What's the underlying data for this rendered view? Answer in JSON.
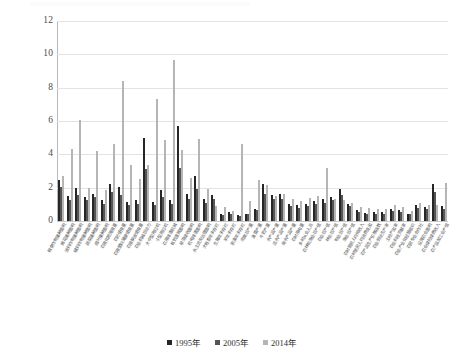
{
  "chart_data": {
    "type": "bar",
    "title": "",
    "subtitle": "",
    "xlabel": "",
    "ylabel": "",
    "ylim": [
      0,
      12
    ],
    "yticks": [
      0,
      2,
      4,
      6,
      8,
      10,
      12
    ],
    "grid": true,
    "legend_position": "bottom",
    "orientation": "vertical",
    "categories": [
      "粮食作物播种面积",
      "棉花播种面积",
      "油料作物播种面积",
      "糖料作物播种面积",
      "蔬菜播种面积",
      "烟叶播种面积",
      "农用化肥施用量",
      "农药使用量",
      "农用塑料薄膜使用量",
      "农用柴油使用量",
      "农业机械总动力",
      "大中型拖拉机",
      "小型拖拉机",
      "农用排灌机械",
      "有效灌溉面积",
      "旱涝保收面积",
      "机电排灌面积",
      "水土流失治理面积",
      "大牲畜年末存栏",
      "生猪年末存栏",
      "羊年末存栏",
      "家禽年末存栏",
      "肉类总产量",
      "禽蛋产量",
      "牛奶产量",
      "水产品产量",
      "淡水产品产量",
      "海水产品产量",
      "农村用电量",
      "乡村从业人员",
      "农林牧渔业总产值",
      "农业总产值",
      "林业总产值",
      "牧业总产值",
      "渔业总产值",
      "农村居民人均纯收入",
      "农村居民人均消费支出",
      "农产品生产价格指数",
      "农业劳动生产率",
      "土地产出率",
      "农业科技贡献率",
      "农业产业化经营组织",
      "农民专业合作社",
      "设施农业面积",
      "农业保险保费收入",
      "农产品加工业产值"
    ],
    "series": [
      {
        "name": "1995年",
        "color": "#262626",
        "values": [
          2.45,
          1.5,
          2.0,
          1.45,
          1.6,
          1.25,
          2.2,
          2.05,
          1.15,
          1.25,
          5.0,
          1.15,
          1.85,
          1.25,
          5.7,
          1.6,
          2.7,
          1.35,
          1.55,
          0.45,
          0.55,
          0.35,
          0.45,
          0.75,
          2.2,
          1.55,
          1.6,
          1.05,
          0.95,
          1.05,
          1.2,
          1.3,
          1.45,
          1.95,
          1.05,
          0.65,
          0.5,
          0.55,
          0.55,
          0.75,
          0.65,
          0.45,
          0.95,
          0.85,
          2.2,
          0.9
        ]
      },
      {
        "name": "2005年",
        "color": "#555555",
        "values": [
          2.05,
          1.25,
          1.55,
          1.25,
          1.45,
          1.0,
          1.75,
          1.55,
          0.95,
          1.05,
          3.15,
          0.95,
          1.45,
          1.05,
          3.2,
          1.3,
          1.95,
          1.1,
          1.3,
          0.35,
          0.45,
          0.3,
          0.4,
          0.65,
          1.65,
          1.3,
          1.35,
          0.9,
          0.8,
          0.9,
          1.0,
          1.1,
          1.25,
          1.55,
          0.9,
          0.55,
          0.45,
          0.45,
          0.45,
          0.6,
          0.55,
          0.4,
          0.8,
          0.7,
          1.75,
          0.75
        ]
      },
      {
        "name": "2014年",
        "color": "#b5b5b5",
        "values": [
          2.7,
          4.35,
          6.05,
          2.0,
          4.2,
          1.85,
          4.6,
          8.4,
          3.35,
          2.55,
          3.35,
          7.35,
          4.85,
          9.65,
          4.25,
          2.6,
          4.9,
          1.95,
          0.9,
          0.85,
          0.6,
          4.6,
          1.2,
          2.45,
          2.15,
          1.5,
          1.65,
          1.35,
          1.2,
          1.4,
          1.5,
          3.2,
          1.3,
          1.25,
          1.1,
          0.85,
          0.8,
          0.75,
          0.7,
          0.95,
          0.85,
          0.6,
          1.1,
          0.95,
          0.95,
          2.3
        ]
      }
    ]
  },
  "legend": {
    "items": [
      {
        "label": "1995年",
        "color": "#262626"
      },
      {
        "label": "2005年",
        "color": "#555555"
      },
      {
        "label": "2014年",
        "color": "#b5b5b5"
      }
    ]
  }
}
